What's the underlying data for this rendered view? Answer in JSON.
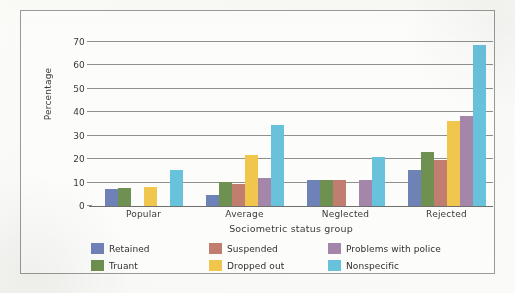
{
  "chart_data": {
    "type": "bar",
    "title": "",
    "xlabel": "Sociometric status group",
    "ylabel": "Percentage",
    "categories": [
      "Popular",
      "Average",
      "Neglected",
      "Rejected"
    ],
    "ylim": [
      0,
      70
    ],
    "yticks": [
      0,
      10,
      20,
      30,
      40,
      50,
      60,
      70
    ],
    "grid": true,
    "legend_position": "bottom",
    "series": [
      {
        "name": "Retained",
        "color": "#6f82b8",
        "values": [
          7.3,
          4.5,
          11.2,
          15.5
        ]
      },
      {
        "name": "Truant",
        "color": "#6e9050",
        "values": [
          7.5,
          10.3,
          11.2,
          23.2
        ]
      },
      {
        "name": "Suspended",
        "color": "#c17e70",
        "values": [
          0,
          9.6,
          11.3,
          19.7
        ]
      },
      {
        "name": "Dropped out",
        "color": "#f1c64d",
        "values": [
          8.3,
          21.7,
          0,
          36.5
        ]
      },
      {
        "name": "Problems with police",
        "color": "#a586ab",
        "values": [
          0,
          11.8,
          11.2,
          38.5
        ]
      },
      {
        "name": "Nonspecific",
        "color": "#68c2dc",
        "values": [
          15.2,
          34.7,
          20.8,
          68.8
        ]
      }
    ]
  },
  "axis": {
    "y_tick_labels": [
      "0",
      "10",
      "20",
      "30",
      "40",
      "50",
      "60",
      "70"
    ],
    "y_title": "Percentage",
    "x_title": "Sociometric status group",
    "x_tick_labels": [
      "Popular",
      "Average",
      "Neglected",
      "Rejected"
    ]
  },
  "legend": {
    "items": [
      {
        "label": "Retained",
        "color": "#6f82b8"
      },
      {
        "label": "Truant",
        "color": "#6e9050"
      },
      {
        "label": "Suspended",
        "color": "#c17e70"
      },
      {
        "label": "Dropped out",
        "color": "#f1c64d"
      },
      {
        "label": "Problems with police",
        "color": "#a586ab"
      },
      {
        "label": "Nonspecific",
        "color": "#68c2dc"
      }
    ]
  }
}
